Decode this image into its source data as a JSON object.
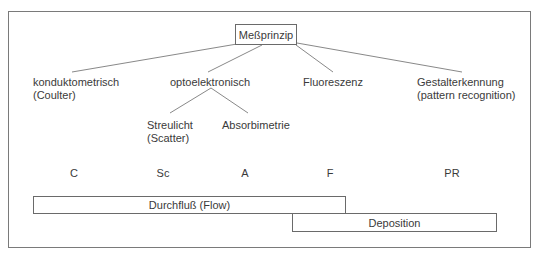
{
  "root": {
    "label": "Meßprinzip"
  },
  "methods": [
    {
      "label": "konduktometrisch",
      "sub": "(Coulter)"
    },
    {
      "label": "optoelektronisch",
      "sub": ""
    },
    {
      "label": "Fluoreszenz",
      "sub": ""
    },
    {
      "label": "Gestalterkennung",
      "sub": "(pattern recognition)"
    }
  ],
  "optoelectronic_children": [
    {
      "label": "Streulicht",
      "sub": "(Scatter)"
    },
    {
      "label": "Absorbimetrie",
      "sub": ""
    }
  ],
  "abbreviations": [
    "C",
    "Sc",
    "A",
    "F",
    "PR"
  ],
  "modes": {
    "flow": "Durchfluß (Flow)",
    "deposition": "Deposition"
  }
}
